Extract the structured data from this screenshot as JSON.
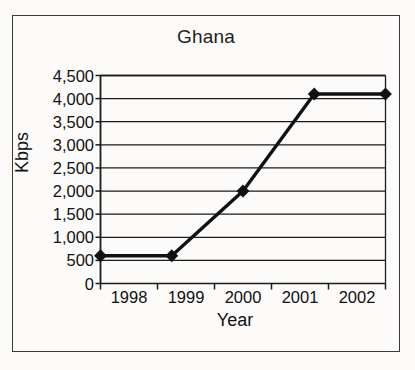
{
  "figure": {
    "title": "Ghana",
    "border_color": "#3a3a3a",
    "background_color": "#fbfaf8"
  },
  "chart_data": {
    "type": "line",
    "title": "Ghana",
    "xlabel": "Year",
    "ylabel": "Kbps",
    "categories": [
      "1998",
      "1999",
      "2000",
      "2001",
      "2002"
    ],
    "values": [
      600,
      600,
      2000,
      4100,
      4100
    ],
    "series": [
      {
        "name": "Ghana",
        "values": [
          600,
          600,
          2000,
          4100,
          4100
        ]
      }
    ],
    "ylim": [
      0,
      4500
    ],
    "ytick_labels": [
      "4,500",
      "4,000",
      "3,500",
      "3,000",
      "2,500",
      "2,000",
      "1,500",
      "1,000",
      "500",
      "0"
    ],
    "ytick_values": [
      4500,
      4000,
      3500,
      3000,
      2500,
      2000,
      1500,
      1000,
      500,
      0
    ],
    "grid": true,
    "grid_axis": "y",
    "legend": false,
    "marker": "diamond",
    "line_color": "#111111",
    "marker_color": "#111111"
  }
}
